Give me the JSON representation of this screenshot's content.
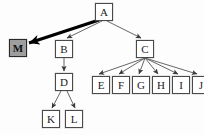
{
  "diagram": {
    "type": "tree-graph",
    "title": "",
    "background_color": "#fdfdfd",
    "node_fill": "#ffffff",
    "node_border": "#4a4a4a",
    "highlight_fill": "#9e9e9e",
    "edge_color": "#555555",
    "emphasis_edge_color": "#000000",
    "nodes": [
      {
        "id": "A",
        "label": "A",
        "x": 95,
        "y": 3,
        "highlight": false
      },
      {
        "id": "M",
        "label": "M",
        "x": 9,
        "y": 39,
        "highlight": true
      },
      {
        "id": "B",
        "label": "B",
        "x": 55,
        "y": 40,
        "highlight": false
      },
      {
        "id": "C",
        "label": "C",
        "x": 136,
        "y": 40,
        "highlight": false
      },
      {
        "id": "D",
        "label": "D",
        "x": 55,
        "y": 73,
        "highlight": false
      },
      {
        "id": "E",
        "label": "E",
        "x": 92,
        "y": 76,
        "highlight": false
      },
      {
        "id": "F",
        "label": "F",
        "x": 112,
        "y": 76,
        "highlight": false
      },
      {
        "id": "G",
        "label": "G",
        "x": 132,
        "y": 76,
        "highlight": false
      },
      {
        "id": "H",
        "label": "H",
        "x": 152,
        "y": 76,
        "highlight": false
      },
      {
        "id": "I",
        "label": "I",
        "x": 172,
        "y": 76,
        "highlight": false
      },
      {
        "id": "J",
        "label": "J",
        "x": 192,
        "y": 76,
        "highlight": false
      },
      {
        "id": "K",
        "label": "K",
        "x": 42,
        "y": 110,
        "highlight": false
      },
      {
        "id": "L",
        "label": "L",
        "x": 65,
        "y": 110,
        "highlight": false
      }
    ],
    "edges": [
      {
        "from": "A",
        "to": "M",
        "emphasis": true,
        "x1": 99,
        "y1": 20,
        "x2": 29,
        "y2": 43
      },
      {
        "from": "A",
        "to": "B",
        "emphasis": false,
        "x1": 102,
        "y1": 21,
        "x2": 67,
        "y2": 38
      },
      {
        "from": "A",
        "to": "C",
        "emphasis": false,
        "x1": 107,
        "y1": 21,
        "x2": 141,
        "y2": 38
      },
      {
        "from": "B",
        "to": "D",
        "emphasis": false,
        "x1": 64,
        "y1": 58,
        "x2": 64,
        "y2": 71
      },
      {
        "from": "D",
        "to": "K",
        "emphasis": false,
        "x1": 61,
        "y1": 91,
        "x2": 52,
        "y2": 108
      },
      {
        "from": "D",
        "to": "L",
        "emphasis": false,
        "x1": 67,
        "y1": 91,
        "x2": 75,
        "y2": 108
      },
      {
        "from": "C",
        "to": "E",
        "emphasis": false,
        "x1": 145,
        "y1": 58,
        "x2": 99,
        "y2": 74
      },
      {
        "from": "C",
        "to": "F",
        "emphasis": false,
        "x1": 145,
        "y1": 58,
        "x2": 119,
        "y2": 74
      },
      {
        "from": "C",
        "to": "G",
        "emphasis": false,
        "x1": 145,
        "y1": 58,
        "x2": 139,
        "y2": 74
      },
      {
        "from": "C",
        "to": "H",
        "emphasis": false,
        "x1": 145,
        "y1": 58,
        "x2": 158,
        "y2": 74
      },
      {
        "from": "C",
        "to": "I",
        "emphasis": false,
        "x1": 145,
        "y1": 58,
        "x2": 178,
        "y2": 74
      },
      {
        "from": "C",
        "to": "J",
        "emphasis": false,
        "x1": 145,
        "y1": 58,
        "x2": 197,
        "y2": 74
      }
    ]
  }
}
